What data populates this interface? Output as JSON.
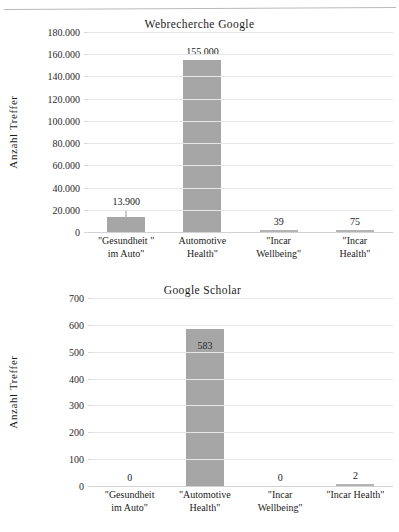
{
  "figure": {
    "background": "#ffffff",
    "bar_color": "#a6a6a6",
    "gridline_color": "#e6e6e6",
    "text_color": "#1c1c1c"
  },
  "chart_data": [
    {
      "type": "bar",
      "title": "Webrecherche Google",
      "xlabel": "",
      "ylabel": "Anzahl Treffer",
      "categories": [
        "\"Gesundheit \"\nim Auto\"",
        "Automotive\nHealth\"",
        "\"Incar\nWellbeing\"",
        "\"Incar\nHealth\""
      ],
      "values": [
        13900,
        155000,
        39,
        75
      ],
      "data_labels": [
        "13.900",
        "155.000",
        "39",
        "75"
      ],
      "ylim": [
        0,
        180000
      ],
      "yticks": [
        0,
        20000,
        40000,
        60000,
        80000,
        100000,
        120000,
        140000,
        160000,
        180000
      ],
      "ytick_labels": [
        "0",
        "20.000",
        "40.000",
        "60.000",
        "80.000",
        "100.000",
        "120.000",
        "140.000",
        "160.000",
        "180.000"
      ],
      "grid": true,
      "legend": false,
      "error_bars": [
        {
          "category_index": 0,
          "present": true
        }
      ]
    },
    {
      "type": "bar",
      "title": "Google Scholar",
      "xlabel": "",
      "ylabel": "Anzahl Treffer",
      "categories": [
        "\"Gesundheit\nim Auto\"",
        "\"Automotive\nHealth\"",
        "\"Incar\nWellbeing\"",
        "\"Incar Health\""
      ],
      "values": [
        0,
        583,
        0,
        2
      ],
      "data_labels": [
        "0",
        "583",
        "0",
        "2"
      ],
      "ylim": [
        0,
        700
      ],
      "yticks": [
        0,
        100,
        200,
        300,
        400,
        500,
        600,
        700
      ],
      "ytick_labels": [
        "0",
        "100",
        "200",
        "300",
        "400",
        "500",
        "600",
        "700"
      ],
      "grid": true,
      "legend": false,
      "error_bars": []
    }
  ]
}
